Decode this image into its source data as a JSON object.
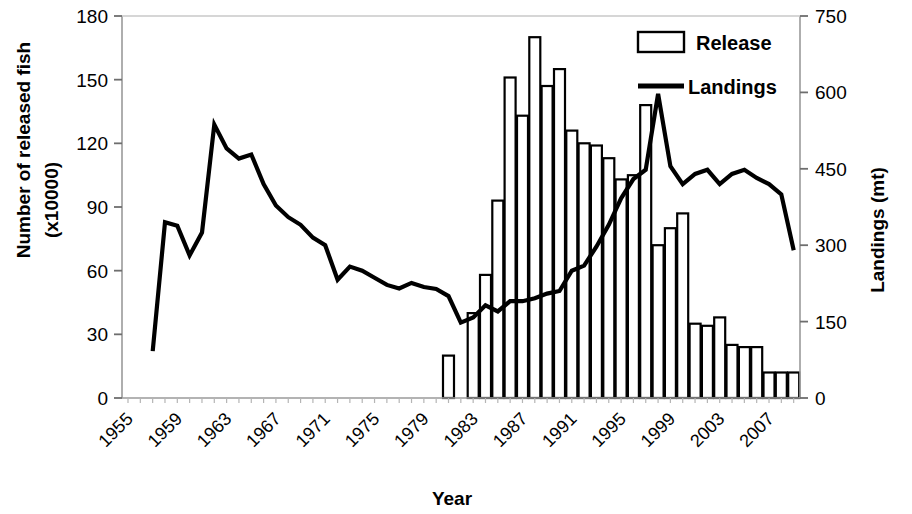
{
  "chart_data": {
    "type": "bar",
    "title": "",
    "xlabel": "Year",
    "ylabel": "Number of released fish (x10000)",
    "ylabel_line1": "Number of released fish",
    "ylabel_line2": "(x10000)",
    "y2label": "Landings (mt)",
    "ylim": [
      0,
      180
    ],
    "y2lim": [
      0,
      750
    ],
    "yticks": [
      "0",
      "30",
      "60",
      "90",
      "120",
      "150",
      "180"
    ],
    "ytick_values": [
      0,
      30,
      60,
      90,
      120,
      150,
      180
    ],
    "y2ticks": [
      "0",
      "150",
      "300",
      "450",
      "600",
      "750"
    ],
    "y2tick_values": [
      0,
      150,
      300,
      450,
      600,
      750
    ],
    "xlim": [
      1955,
      2010
    ],
    "xticks": [
      "1955",
      "1959",
      "1963",
      "1967",
      "1971",
      "1975",
      "1979",
      "1983",
      "1987",
      "1991",
      "1995",
      "1999",
      "2003",
      "2007"
    ],
    "xtick_values": [
      1955,
      1959,
      1963,
      1967,
      1971,
      1975,
      1979,
      1983,
      1987,
      1991,
      1995,
      1999,
      2003,
      2007
    ],
    "grid": false,
    "legend_position": "top-right",
    "x": [
      1955,
      1956,
      1957,
      1958,
      1959,
      1960,
      1961,
      1962,
      1963,
      1964,
      1965,
      1966,
      1967,
      1968,
      1969,
      1970,
      1971,
      1972,
      1973,
      1974,
      1975,
      1976,
      1977,
      1978,
      1979,
      1980,
      1981,
      1982,
      1983,
      1984,
      1985,
      1986,
      1987,
      1988,
      1989,
      1990,
      1991,
      1992,
      1993,
      1994,
      1995,
      1996,
      1997,
      1998,
      1999,
      2000,
      2001,
      2002,
      2003,
      2004,
      2005,
      2006,
      2007,
      2008,
      2009
    ],
    "series": [
      {
        "name": "Release",
        "type": "bar",
        "axis": "left",
        "unit": "x10000 fish",
        "x": [
          1981,
          1983,
          1984,
          1985,
          1986,
          1987,
          1988,
          1989,
          1990,
          1991,
          1992,
          1993,
          1994,
          1995,
          1996,
          1997,
          1998,
          1999,
          2000,
          2001,
          2002,
          2003,
          2004,
          2005,
          2006,
          2007,
          2008,
          2009
        ],
        "values": [
          20,
          40,
          58,
          93,
          151,
          133,
          170,
          147,
          155,
          126,
          120,
          119,
          113,
          103,
          105,
          138,
          72,
          80,
          87,
          35,
          34,
          38,
          25,
          24,
          24,
          12,
          12,
          12
        ]
      },
      {
        "name": "Landings",
        "type": "line",
        "axis": "right",
        "unit": "mt",
        "x": [
          1957,
          1958,
          1959,
          1960,
          1961,
          1962,
          1963,
          1964,
          1965,
          1966,
          1967,
          1968,
          1969,
          1970,
          1971,
          1972,
          1973,
          1974,
          1975,
          1976,
          1977,
          1978,
          1979,
          1980,
          1981,
          1982,
          1983,
          1984,
          1985,
          1986,
          1987,
          1988,
          1989,
          1990,
          1991,
          1992,
          1993,
          1994,
          1995,
          1996,
          1997,
          1998,
          1999,
          2000,
          2001,
          2002,
          2003,
          2004,
          2005,
          2006,
          2007,
          2008,
          2009
        ],
        "values": [
          92,
          345,
          338,
          280,
          325,
          537,
          490,
          470,
          478,
          420,
          378,
          355,
          340,
          315,
          300,
          232,
          258,
          250,
          236,
          222,
          215,
          226,
          218,
          214,
          200,
          148,
          158,
          182,
          170,
          190,
          190,
          196,
          205,
          210,
          250,
          260,
          297,
          340,
          392,
          430,
          448,
          597,
          455,
          420,
          440,
          448,
          420,
          440,
          448,
          432,
          420,
          400,
          290
        ]
      }
    ]
  },
  "legend": {
    "items": [
      {
        "label": "Release",
        "marker": "bar-swatch"
      },
      {
        "label": "Landings",
        "marker": "line-swatch"
      }
    ]
  },
  "colors": {
    "axis": "#000000",
    "bar_fill": "#ffffff",
    "bar_stroke": "#000000",
    "line": "#000000",
    "background": "#ffffff"
  }
}
